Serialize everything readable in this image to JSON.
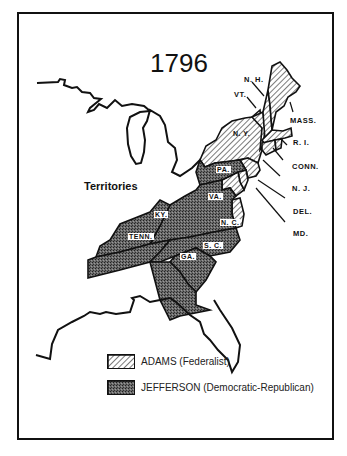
{
  "title": "1796",
  "region_label": "Territories",
  "colors": {
    "adams_fill": "hatched-light-gray",
    "jefferson_fill": "#5a5a5a",
    "outline": "#111111"
  },
  "state_labels": {
    "nh": "N. H.",
    "vt": "VT.",
    "mass": "MASS.",
    "ny": "N. Y.",
    "ri": "R. I.",
    "conn": "CONN.",
    "pa": "PA.",
    "nj": "N. J.",
    "del": "DEL.",
    "md": "MD.",
    "va": "VA.",
    "ky": "KY.",
    "nc": "N. C.",
    "tenn": "TENN.",
    "sc": "S. C.",
    "ga": "GA."
  },
  "legend": [
    {
      "label": "ADAMS  (Federalist)",
      "pattern": "hatched"
    },
    {
      "label": "JEFFERSON  (Democratic-Republican)",
      "pattern": "dark-stipple"
    }
  ],
  "results": {
    "adams": [
      "N.H.",
      "VT.",
      "MASS.",
      "N.Y.",
      "R.I.",
      "CONN.",
      "N.J.",
      "DEL.",
      "MD. (split)"
    ],
    "jefferson": [
      "PA.",
      "VA.",
      "KY.",
      "N.C.",
      "TENN.",
      "S.C.",
      "GA.",
      "MD. (split)"
    ]
  }
}
